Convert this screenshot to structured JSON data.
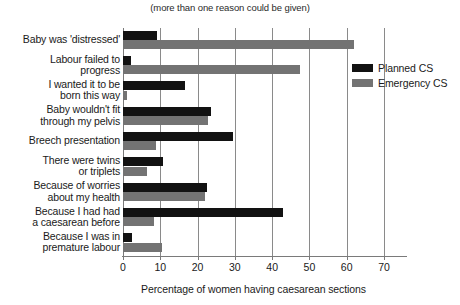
{
  "chart_data": {
    "type": "bar",
    "orientation": "horizontal",
    "title": "",
    "subtitle": "(more than one reason could be given)",
    "xlabel": "Percentage of women having caesarean sections",
    "ylabel": "",
    "xlim": [
      0,
      70
    ],
    "xticks": [
      0,
      10,
      20,
      30,
      40,
      50,
      60,
      70
    ],
    "grid": "vertical",
    "legend_position": "right",
    "categories": [
      "Baby was 'distressed'",
      "Labour failed to progress",
      "I wanted it to be born this way",
      "Baby wouldn't fit through my pelvis",
      "Breech presentation",
      "There were twins or triplets",
      "Because of worries about my health",
      "Because I had had a caesarean before",
      "Because I was in premature labour"
    ],
    "category_lines": [
      [
        "Baby was 'distressed'"
      ],
      [
        "Labour failed to",
        "progress"
      ],
      [
        "I wanted it to be",
        "born this way"
      ],
      [
        "Baby wouldn't fit",
        "through my pelvis"
      ],
      [
        "Breech presentation"
      ],
      [
        "There were twins",
        "or triplets"
      ],
      [
        "Because of worries",
        "about my health"
      ],
      [
        "Because I had had",
        "a caesarean before"
      ],
      [
        "Because I was in",
        "premature labour"
      ]
    ],
    "series": [
      {
        "name": "Planned CS",
        "color": "#121212",
        "values": [
          9.2,
          2.2,
          16.5,
          23.6,
          29.4,
          10.8,
          22.4,
          42.8,
          2.3
        ]
      },
      {
        "name": "Emergency CS",
        "color": "#737373",
        "values": [
          61.9,
          47.5,
          1.2,
          22.9,
          8.9,
          6.5,
          22.1,
          8.3,
          10.4
        ]
      }
    ]
  },
  "legend": {
    "items": [
      {
        "label": "Planned CS",
        "color": "#121212"
      },
      {
        "label": "Emergency CS",
        "color": "#737373"
      }
    ]
  }
}
